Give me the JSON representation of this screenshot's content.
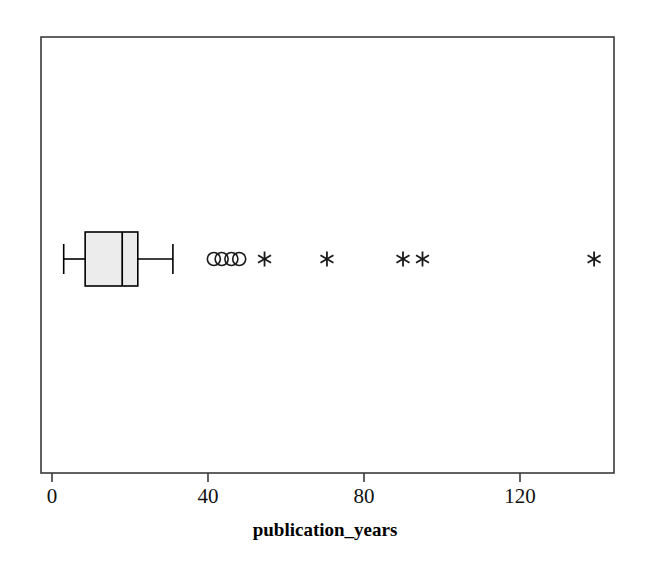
{
  "chart_data": {
    "type": "box",
    "title": "",
    "subtitle": "",
    "orientation": "horizontal",
    "xlabel": "publication_years",
    "ylabel": "",
    "xlim": [
      -3,
      147
    ],
    "xticks": [
      0,
      40,
      80,
      120
    ],
    "xtick_labels": [
      "0",
      "40",
      "80",
      "120"
    ],
    "grid": false,
    "legend": false,
    "series": [
      {
        "name": "publication_years",
        "whisker_low": 3,
        "q1": 8.5,
        "median": 18,
        "q3": 22,
        "whisker_high": 31,
        "box_fill": "#ececec",
        "line_color": "#000000",
        "mild_outliers": [
          41.5,
          43.5,
          46,
          48
        ],
        "extreme_outliers": [
          54.5,
          70.5,
          90,
          95,
          139
        ],
        "mild_outlier_marker": "circle",
        "extreme_outlier_marker": "asterisk"
      }
    ]
  },
  "axis": {
    "x_title": "publication_years",
    "tick_0": "0",
    "tick_40": "40",
    "tick_80": "80",
    "tick_120": "120"
  },
  "colors": {
    "frame": "#3a3a3a",
    "box_fill": "#ececec",
    "marker": "#1a1a1a",
    "background": "#ffffff"
  }
}
